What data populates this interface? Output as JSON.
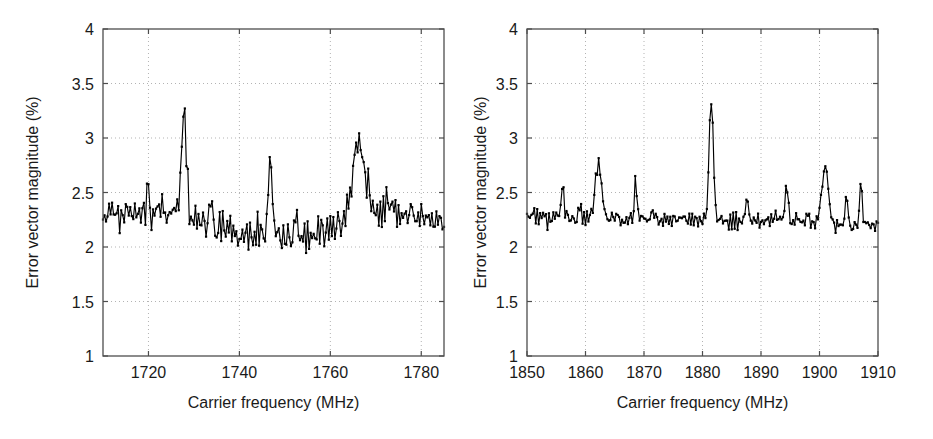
{
  "figure": {
    "background_color": "#ffffff",
    "line_color": "#000000",
    "axis_color": "#4d4d4d",
    "grid_color": "#b3b3b3",
    "text_color": "#1a1a1a"
  },
  "chart_data": [
    {
      "type": "line",
      "panel": "left",
      "title": "",
      "xlabel": "Carrier frequency (MHz)",
      "ylabel": "Error vector magnitude (%)",
      "xlim": [
        1710,
        1785
      ],
      "ylim": [
        1,
        4
      ],
      "xticks": [
        1720,
        1740,
        1760,
        1780
      ],
      "xtick_labels": [
        "1720",
        "1740",
        "1760",
        "1780"
      ],
      "yticks": [
        1,
        1.5,
        2,
        2.5,
        3,
        3.5,
        4
      ],
      "ytick_labels": [
        "1",
        "1.5",
        "2",
        "2.5",
        "3",
        "3.5",
        "4"
      ],
      "grid": true,
      "grid_style": "dotted",
      "legend": "none",
      "marker": "dot",
      "n_points": 226,
      "seed": 20731,
      "noise_amplitude": 0.115,
      "baseline_nodes": [
        {
          "x": 1710,
          "y": 2.3
        },
        {
          "x": 1716,
          "y": 2.32
        },
        {
          "x": 1722,
          "y": 2.33
        },
        {
          "x": 1727,
          "y": 2.29
        },
        {
          "x": 1732,
          "y": 2.25
        },
        {
          "x": 1737,
          "y": 2.18
        },
        {
          "x": 1741,
          "y": 2.11
        },
        {
          "x": 1746,
          "y": 2.11
        },
        {
          "x": 1750,
          "y": 2.08
        },
        {
          "x": 1754,
          "y": 2.09
        },
        {
          "x": 1758,
          "y": 2.15
        },
        {
          "x": 1762,
          "y": 2.22
        },
        {
          "x": 1766,
          "y": 2.3
        },
        {
          "x": 1770,
          "y": 2.33
        },
        {
          "x": 1775,
          "y": 2.33
        },
        {
          "x": 1780,
          "y": 2.3
        },
        {
          "x": 1785,
          "y": 2.2
        }
      ],
      "peaks": [
        {
          "x": 1727.8,
          "y": 3.22,
          "width": 0.55,
          "label": "primary spur"
        },
        {
          "x": 1746.8,
          "y": 2.78,
          "width": 0.4,
          "label": "spur"
        },
        {
          "x": 1766.2,
          "y": 2.93,
          "width": 1.3,
          "label": "broad spur"
        },
        {
          "x": 1719.8,
          "y": 2.56,
          "width": 0.3,
          "label": "spur"
        },
        {
          "x": 1733.8,
          "y": 2.45,
          "width": 0.3,
          "label": "spur"
        },
        {
          "x": 1752.5,
          "y": 2.33,
          "width": 0.3,
          "label": "spur"
        }
      ],
      "notes": "Dense noisy trace with marker dots; broad dip between 1740 and 1758 MHz."
    },
    {
      "type": "line",
      "panel": "right",
      "title": "",
      "xlabel": "Carrier frequency (MHz)",
      "ylabel": "Error vector magnitude (%)",
      "xlim": [
        1850,
        1910
      ],
      "ylim": [
        1,
        4
      ],
      "xticks": [
        1850,
        1860,
        1870,
        1880,
        1890,
        1900,
        1910
      ],
      "xtick_labels": [
        "1850",
        "1860",
        "1870",
        "1880",
        "1890",
        "1900",
        "1910"
      ],
      "yticks": [
        1,
        1.5,
        2,
        2.5,
        3,
        3.5,
        4
      ],
      "ytick_labels": [
        "1",
        "1.5",
        "2",
        "2.5",
        "3",
        "3.5",
        "4"
      ],
      "grid": true,
      "grid_style": "dotted",
      "legend": "none",
      "marker": "dot",
      "n_points": 241,
      "seed": 91447,
      "noise_amplitude": 0.055,
      "baseline_nodes": [
        {
          "x": 1850,
          "y": 2.28
        },
        {
          "x": 1856,
          "y": 2.26
        },
        {
          "x": 1862,
          "y": 2.26
        },
        {
          "x": 1868,
          "y": 2.26
        },
        {
          "x": 1874,
          "y": 2.25
        },
        {
          "x": 1880,
          "y": 2.25
        },
        {
          "x": 1884,
          "y": 2.24
        },
        {
          "x": 1890,
          "y": 2.25
        },
        {
          "x": 1896,
          "y": 2.24
        },
        {
          "x": 1900,
          "y": 2.23
        },
        {
          "x": 1903,
          "y": 2.18
        },
        {
          "x": 1906,
          "y": 2.19
        },
        {
          "x": 1910,
          "y": 2.19
        }
      ],
      "peaks": [
        {
          "x": 1881.5,
          "y": 3.35,
          "width": 0.36,
          "label": "primary spur"
        },
        {
          "x": 1862.2,
          "y": 2.77,
          "width": 0.55,
          "label": "spur"
        },
        {
          "x": 1901.0,
          "y": 2.76,
          "width": 0.55,
          "label": "spur"
        },
        {
          "x": 1856.1,
          "y": 2.59,
          "width": 0.22,
          "label": "spur"
        },
        {
          "x": 1868.6,
          "y": 2.62,
          "width": 0.22,
          "label": "spur"
        },
        {
          "x": 1894.4,
          "y": 2.6,
          "width": 0.22,
          "label": "spur"
        },
        {
          "x": 1907.1,
          "y": 2.61,
          "width": 0.22,
          "label": "spur"
        },
        {
          "x": 1887.6,
          "y": 2.42,
          "width": 0.22,
          "label": "spur"
        },
        {
          "x": 1904.6,
          "y": 2.44,
          "width": 0.22,
          "label": "spur"
        },
        {
          "x": 1859.0,
          "y": 2.39,
          "width": 0.22,
          "label": "spur"
        },
        {
          "x": 1871.5,
          "y": 2.36,
          "width": 0.22,
          "label": "spur"
        },
        {
          "x": 1898.0,
          "y": 2.33,
          "width": 0.22,
          "label": "spur"
        }
      ],
      "notes": "Flat low-variance floor near 2.25 percent with several narrow spurs."
    }
  ]
}
